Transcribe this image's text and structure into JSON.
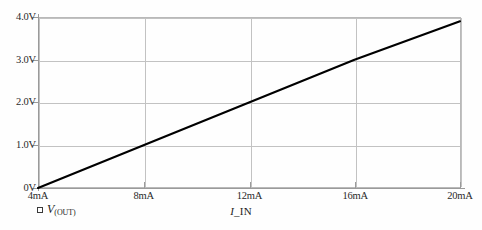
{
  "figure": {
    "background_color": "#fefefe",
    "plot_frame_color": "#b9b9b9",
    "gridline_color": "#c2c2c2",
    "line_color": "#000000"
  },
  "chart_data": {
    "type": "line",
    "title": "",
    "subtitle": "",
    "xlabel": "I_IN",
    "ylabel": "",
    "xlim": [
      4,
      20
    ],
    "ylim": [
      0,
      4
    ],
    "grid": true,
    "legend_position": "below-left",
    "x_unit": "mA",
    "y_unit": "V",
    "x_tick_values": [
      4,
      8,
      12,
      16,
      20
    ],
    "x_tick_labels": [
      "4mA",
      "8mA",
      "12mA",
      "16mA",
      "20mA"
    ],
    "y_tick_values": [
      0,
      1,
      2,
      3,
      4
    ],
    "y_tick_labels": [
      "0V",
      "1.0V",
      "2.0V",
      "3.0V",
      "4.0V"
    ],
    "series": [
      {
        "name": "V(OUT)",
        "color": "#000000",
        "x": [
          4,
          8,
          12,
          16,
          20
        ],
        "values": [
          0.0,
          1.0,
          2.0,
          3.0,
          3.9
        ]
      }
    ],
    "annotations": []
  },
  "legend": {
    "marker": "square-marker",
    "symbol": "V",
    "subscript": "(OUT)"
  },
  "axis": {
    "x_title_italic": "I",
    "x_title_rest": "_IN"
  }
}
